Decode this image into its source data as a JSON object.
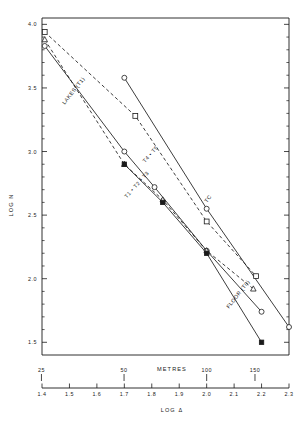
{
  "figure": {
    "background": "#ffffff",
    "ink": "#1a1a1a"
  },
  "axes": {
    "y_title": "LOG  N",
    "x_title": "LOG  Δ",
    "secondary_x_title": "METRES",
    "y_ticklabels": [
      "1.5",
      "2.0",
      "2.5",
      "3.0",
      "3.5",
      "4.0"
    ],
    "x_ticklabels": [
      "1.4",
      "1.5",
      "1.6",
      "1.7",
      "1.8",
      "1.9",
      "2.0",
      "2.1",
      "2.2",
      "2.3"
    ],
    "metres_ticklabels": [
      "25",
      "50",
      "100",
      "150"
    ]
  },
  "chart_data": {
    "type": "line",
    "title": "",
    "xlabel": "LOG Δ",
    "ylabel": "LOG N",
    "xlim": [
      1.4,
      2.3
    ],
    "ylim": [
      1.4,
      4.05
    ],
    "grid": false,
    "legend": "inline-labels",
    "secondary_x_axis": {
      "label": "METRES",
      "ticks": [
        {
          "label": "25",
          "log_delta": 1.398
        },
        {
          "label": "50",
          "log_delta": 1.699
        },
        {
          "label": "100",
          "log_delta": 2.0
        },
        {
          "label": "150",
          "log_delta": 2.176
        }
      ]
    },
    "series": [
      {
        "name": "LAKES (T1)",
        "label": "LAKES (T1)",
        "style": "solid",
        "marker": "circle-open",
        "x": [
          1.41,
          1.7,
          1.81,
          2.0,
          2.2
        ],
        "y": [
          3.83,
          3.0,
          2.72,
          2.22,
          1.74
        ]
      },
      {
        "name": "T4 + T5",
        "label": "T4 • T5",
        "style": "dashed",
        "marker": "square-open",
        "x": [
          1.41,
          1.74,
          2.0,
          2.18
        ],
        "y": [
          3.94,
          3.28,
          2.45,
          2.02
        ]
      },
      {
        "name": "T1 + T2 + T3",
        "label": "T1 • T2 • T3",
        "style": "dashed",
        "marker": "triangle-open",
        "x": [
          1.41,
          1.7,
          1.84,
          2.0,
          2.17
        ],
        "y": [
          3.88,
          2.9,
          2.62,
          2.22,
          1.92
        ]
      },
      {
        "name": "TC",
        "label": "TC",
        "style": "solid",
        "marker": "circle-open",
        "x": [
          1.7,
          2.0,
          2.3
        ],
        "y": [
          3.58,
          2.55,
          1.62
        ]
      },
      {
        "name": "FLOOR (T0)",
        "label": "FLOOR (T0)",
        "style": "solid",
        "marker": "square-filled",
        "x": [
          1.7,
          1.84,
          2.0,
          2.2
        ],
        "y": [
          2.9,
          2.6,
          2.2,
          1.5
        ]
      }
    ],
    "annotations": [
      {
        "text": "LAKES (T1)",
        "x": 1.52,
        "y": 3.47,
        "rotation": -52
      },
      {
        "text": "T4 • T5",
        "x": 1.8,
        "y": 2.97,
        "rotation": -48
      },
      {
        "text": "T1 • T2 • T3",
        "x": 1.75,
        "y": 2.73,
        "rotation": -48
      },
      {
        "text": "TC",
        "x": 2.01,
        "y": 2.62,
        "rotation": -52
      },
      {
        "text": "FLOOR (T0)",
        "x": 2.12,
        "y": 1.87,
        "rotation": -52
      }
    ]
  }
}
